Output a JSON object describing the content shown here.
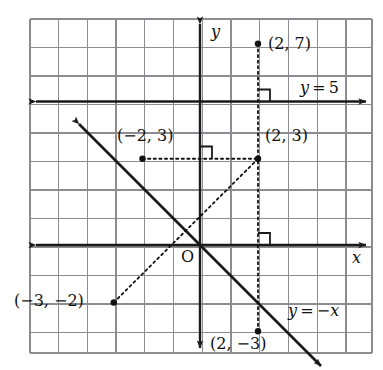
{
  "figure": {
    "kind": "coordinate-plane-diagram",
    "background": "#ffffff",
    "grid_color": "#8c8c93",
    "axis_color": "#1a1a1a",
    "line_color": "#1a1a1a",
    "dot_color": "#111111"
  },
  "grid": {
    "left_px": 30,
    "top_px": 19,
    "right_px": 372,
    "bottom_px": 353,
    "cell_px": 28.75,
    "origin_px": {
      "x": 200,
      "y": 245
    },
    "columns": 12,
    "rows": 12
  },
  "axes": {
    "x_axis": {
      "name": "x-axis",
      "label": "x",
      "y_value": 0,
      "arrows": "both"
    },
    "y_axis": {
      "name": "y-axis",
      "label": "y",
      "x_value": 0,
      "arrows": "both"
    },
    "origin_label": "O"
  },
  "lines": [
    {
      "name": "line-y-equals-5",
      "label": "y = 5",
      "equation_parts": {
        "lhs": "y",
        "op": "=",
        "rhs": "5"
      },
      "style": "solid",
      "arrows": "both",
      "y_value": 5
    },
    {
      "name": "line-y-equals-negative-x",
      "label": "y = −x",
      "equation_parts": {
        "lhs": "y",
        "op": "=",
        "rhs": "−x"
      },
      "style": "solid",
      "arrows": "both",
      "slope": -1,
      "intercept": 0
    }
  ],
  "points": [
    {
      "name": "point-2-7",
      "label": "(2, 7)",
      "x": 2,
      "y": 7,
      "px": {
        "x": 258,
        "y": 43.75
      },
      "label_px": {
        "x": 268,
        "y": 36
      }
    },
    {
      "name": "point-2-3",
      "label": "(2, 3)",
      "x": 2,
      "y": 3,
      "px": {
        "x": 258,
        "y": 158.75
      },
      "label_px": {
        "x": 265,
        "y": 128
      }
    },
    {
      "name": "point-neg2-3",
      "label": "(−2, 3)",
      "x": -2,
      "y": 3,
      "px": {
        "x": 142.5,
        "y": 158.75
      },
      "label_px": {
        "x": 117,
        "y": 128
      }
    },
    {
      "name": "point-neg3-neg2",
      "label": "(−3, −2)",
      "x": -3,
      "y": -2,
      "px": {
        "x": 113.75,
        "y": 302.5
      },
      "label_px": {
        "x": 14,
        "y": 293
      }
    },
    {
      "name": "point-2-neg3",
      "label": "(2, −3)",
      "x": 2,
      "y": -3,
      "px": {
        "x": 258,
        "y": 331.25
      },
      "label_px": {
        "x": 210,
        "y": 336
      }
    }
  ],
  "dashed_segments": [
    {
      "name": "dashed-vertical-x-equals-2",
      "from": {
        "x": 2,
        "y": 7
      },
      "to": {
        "x": 2,
        "y": -3
      },
      "style": "dotted"
    },
    {
      "name": "dashed-horizontal-y-equals-3",
      "from": {
        "x": -2,
        "y": 3
      },
      "to": {
        "x": 2,
        "y": 3
      },
      "style": "dotted"
    },
    {
      "name": "dashed-segment-neg3neg2-to-2-3",
      "from": {
        "x": -3,
        "y": -2
      },
      "to": {
        "x": 2,
        "y": 3
      },
      "style": "dotted"
    }
  ],
  "right_angle_marks": [
    {
      "name": "right-angle-mark-at-y5-line",
      "at_px": {
        "x": 258,
        "y": 101.5
      },
      "quadrant": "upper-right"
    },
    {
      "name": "right-angle-mark-at-y-equals-negx",
      "at_px": {
        "x": 200,
        "y": 158.75
      },
      "quadrant": "upper-right"
    },
    {
      "name": "right-angle-mark-at-x-axis",
      "at_px": {
        "x": 258,
        "y": 245
      },
      "quadrant": "upper-right"
    }
  ],
  "axis_labels": {
    "x": "x",
    "y": "y"
  },
  "equation_labels": {
    "y5": {
      "lhs": "y",
      "eq": "=",
      "rhs": "5",
      "px": {
        "x": 300,
        "y": 80
      }
    },
    "ynegx": {
      "lhs": "y",
      "eq": "=",
      "rhs": "−x",
      "px": {
        "x": 288,
        "y": 303
      }
    }
  }
}
